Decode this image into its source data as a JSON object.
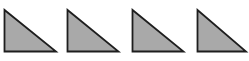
{
  "diagram": {
    "background": "#ffffff",
    "fill_color": "#a9a9a9",
    "stroke_color": "#1e1e1e",
    "stroke_width": 1.8,
    "shapes": [
      {
        "type": "right-triangle",
        "points": [
          [
            4.5,
            10
          ],
          [
            4.5,
            51.5
          ],
          [
            56,
            51.5
          ]
        ]
      },
      {
        "type": "right-triangle",
        "points": [
          [
            67.5,
            10
          ],
          [
            67.5,
            51.5
          ],
          [
            118.5,
            51.5
          ]
        ]
      },
      {
        "type": "right-triangle",
        "points": [
          [
            132.5,
            10
          ],
          [
            132.5,
            51.5
          ],
          [
            183.5,
            51.5
          ]
        ]
      },
      {
        "type": "right-triangle",
        "points": [
          [
            197.5,
            10
          ],
          [
            197.5,
            51.5
          ],
          [
            246,
            51.5
          ]
        ]
      }
    ]
  }
}
